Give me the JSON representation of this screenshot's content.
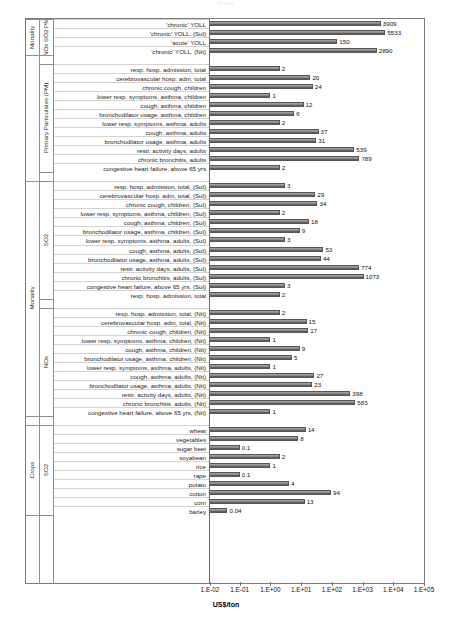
{
  "title_faint": "Umwelt",
  "axis": {
    "xlabel": "US$/ton",
    "ticks": [
      "1.E-02",
      "1.E-01",
      "1.E+00",
      "1.E+01",
      "1.E+02",
      "1.E+03",
      "1.E+04",
      "1.E+05"
    ],
    "xmin": 0.01,
    "xmax": 100000
  },
  "group_labels": {
    "mortality_top": "Mortality",
    "noxso2_pm": "NOx SO2 PM",
    "primary_particulates": "Primary Particulates (PM)",
    "mortality_mid": "Mortality",
    "so2": "SO2",
    "nox": "NOx",
    "crops": "Crops",
    "crops_so2": "SO2"
  },
  "chart_data": {
    "type": "bar",
    "orientation": "horizontal",
    "title": "",
    "xlabel": "US$/ton",
    "ylabel": "",
    "xscale": "log",
    "xlim": [
      0.01,
      100000
    ],
    "grid": true,
    "legend": false,
    "groups": [
      {
        "outer": "Mortality",
        "inner": "NOx SO2 PM",
        "categories": [
          "'chronic' YOLL",
          "'chronic' YOLL, (Sul)",
          "'acute' YOLL",
          "'chronic' YOLL, (Nit)"
        ],
        "values": [
          3909,
          5533,
          150,
          2890
        ],
        "labels": [
          "3909",
          "5533",
          "150",
          "2890"
        ]
      },
      {
        "outer": "",
        "inner": "Primary Particulates (PM)",
        "categories": [
          "resp. hosp. admission, total",
          "cerebrovascular hosp. adm, total",
          "chronic cough, children",
          "lower resp. symptoms, asthma, children",
          "cough, asthma, children",
          "bronchodilator usage, asthma, children",
          "lower resp. symptoms, asthma, adults",
          "cough, asthma, adults",
          "bronchodilator usage, asthma, adults",
          "restr. activity days, adults",
          "chronic bronchitis, adults",
          "congestive heart failure, above 65 yrs"
        ],
        "values": [
          2,
          20,
          24,
          1,
          12,
          6,
          2,
          37,
          31,
          539,
          789,
          2
        ],
        "labels": [
          "2",
          "20",
          "24",
          "1",
          "12",
          "6",
          "2",
          "37",
          "31",
          "539",
          "789",
          "2"
        ]
      },
      {
        "outer": "Mortality",
        "inner": "SO2",
        "categories": [
          "resp. hosp. admission, total, (Sul)",
          "cerebrovascular hosp. adm, total, (Sul)",
          "chronic cough, children, (Sul)",
          "lower resp. symptoms, asthma, children, (Sul)",
          "cough, asthma, children, (Sul)",
          "bronchodilator usage, asthma, children, (Sul)",
          "lower resp. symptoms, asthma, adults, (Sul)",
          "cough, asthma, adults, (Sul)",
          "bronchodilator usage, asthma, adults, (Sul)",
          "restr. activity days, adults, (Sul)",
          "chronic bronchitis, adults, (Sul)",
          "congestive heart failure, above 65 yrs, (Sul)",
          "resp. hosp. admission, total"
        ],
        "values": [
          3,
          29,
          34,
          2,
          18,
          9,
          3,
          53,
          44,
          774,
          1073,
          3,
          2
        ],
        "labels": [
          "3",
          "29",
          "34",
          "2",
          "18",
          "9",
          "3",
          "53",
          "44",
          "774",
          "1073",
          "3",
          "2"
        ]
      },
      {
        "outer": "",
        "inner": "NOx",
        "categories": [
          "resp. hosp. admission, total, (Nit)",
          "cerebrovascular hosp. adm, total, (Nit)",
          "chronic cough, children, (Nit)",
          "lower resp. symptoms, asthma, children, (Nit)",
          "cough, asthma, children, (Nit)",
          "bronchodilator usage, asthma, children, (Nit)",
          "lower resp. symptoms, asthma, adults, (Nit)",
          "cough, asthma, adults, (Nit)",
          "bronchodilator usage, asthma, adults, (Nit)",
          "restr. activity days, adults, (Nit)",
          "chronic bronchitis, adults, (Nit)",
          "congestive heart failure, above 65 yrs, (Nit)"
        ],
        "values": [
          2,
          15,
          17,
          1,
          9,
          5,
          1,
          27,
          23,
          398,
          583,
          1
        ],
        "labels": [
          "2",
          "15",
          "17",
          "1",
          "9",
          "5",
          "1",
          "27",
          "23",
          "398",
          "583",
          "1"
        ]
      },
      {
        "outer": "Crops",
        "inner": "SO2",
        "categories": [
          "wheat",
          "vegetables",
          "sugar beet",
          "soyabean",
          "rice",
          "rape",
          "potato",
          "cotton",
          "corn",
          "barley"
        ],
        "values": [
          14,
          8,
          0.1,
          2,
          1,
          0.1,
          4,
          94,
          13,
          0.04
        ],
        "labels": [
          "14",
          "8",
          "0.1",
          "2",
          "1",
          "0.1",
          "4",
          "94",
          "13",
          "0.04"
        ]
      }
    ]
  }
}
